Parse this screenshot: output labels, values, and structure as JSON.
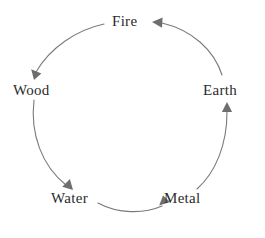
{
  "diagram": {
    "name": "five-elements-cycle",
    "background_color": "#ffffff",
    "stroke_color": "#7a7a7a",
    "text_color": "#2b2b2b",
    "nodes": [
      {
        "id": "fire",
        "label": "Fire",
        "position": "top",
        "x": 132,
        "y": 22
      },
      {
        "id": "wood",
        "label": "Wood",
        "position": "left",
        "x": 34,
        "y": 90
      },
      {
        "id": "earth",
        "label": "Earth",
        "position": "right",
        "x": 225,
        "y": 90
      },
      {
        "id": "water",
        "label": "Water",
        "position": "bottom-left",
        "x": 77,
        "y": 198
      },
      {
        "id": "metal",
        "label": "Metal",
        "position": "bottom-right",
        "x": 186,
        "y": 198
      }
    ],
    "edges": [
      {
        "id": "fire-to-wood",
        "from": "Fire",
        "to": "Wood",
        "arrow": "end"
      },
      {
        "id": "wood-to-water",
        "from": "Wood",
        "to": "Water",
        "arrow": "end"
      },
      {
        "id": "water-to-metal",
        "from": "Water",
        "to": "Metal",
        "arrow": "end"
      },
      {
        "id": "metal-to-earth",
        "from": "Metal",
        "to": "Earth",
        "arrow": "end"
      },
      {
        "id": "earth-to-fire",
        "from": "Earth",
        "to": "Fire",
        "arrow": "end"
      }
    ],
    "direction": "clockwise-from-fire-through-wood-water-metal-earth"
  }
}
